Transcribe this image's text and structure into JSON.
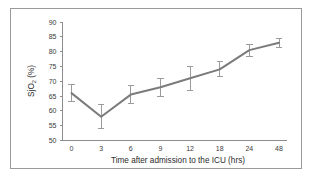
{
  "chart_data": {
    "type": "line",
    "title": "",
    "xlabel": "Time after admission to the ICU (hrs)",
    "ylabel": "SjO2 (%)",
    "ylabel_parts": {
      "pre": "SjO",
      "sub": "2",
      "post": " (%)"
    },
    "categories": [
      "0",
      "3",
      "6",
      "9",
      "12",
      "18",
      "24",
      "48"
    ],
    "x": [
      0,
      3,
      6,
      9,
      12,
      18,
      24,
      48
    ],
    "values": [
      66,
      58,
      65.5,
      68,
      71,
      74,
      80.5,
      83
    ],
    "errors": [
      3,
      4,
      3,
      3,
      4,
      2.5,
      2,
      1.5
    ],
    "series": [
      {
        "name": "SjO2",
        "values": [
          66,
          58,
          65.5,
          68,
          71,
          74,
          80.5,
          83
        ],
        "errors": [
          3,
          4,
          3,
          3,
          4,
          2.5,
          2,
          1.5
        ]
      }
    ],
    "yticks": [
      50,
      55,
      60,
      65,
      70,
      75,
      80,
      85,
      90
    ],
    "ytick_labels": [
      "50",
      "55",
      "60",
      "65",
      "70",
      "75",
      "80",
      "85",
      "90"
    ],
    "xtick_labels": [
      "0",
      "3",
      "6",
      "9",
      "12",
      "18",
      "24",
      "48"
    ],
    "ylim": [
      50,
      90
    ],
    "grid": false,
    "legend": false,
    "legend_position": "none",
    "line_color": "#7b7b7b",
    "errorbar_color": "#9b9b9b",
    "axis_color": "#8d8d8d",
    "text_color": "#3b3b3b",
    "background_color": "#ffffff",
    "border_color": "#9a9a9a"
  }
}
